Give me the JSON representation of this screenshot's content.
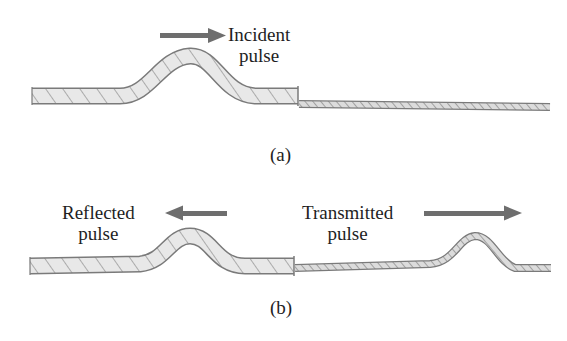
{
  "panels": [
    {
      "id": "a",
      "caption": "(a)",
      "labels": [
        {
          "line1": "Incident",
          "line2": "pulse",
          "arrow_direction": "right"
        }
      ]
    },
    {
      "id": "b",
      "caption": "(b)",
      "labels": [
        {
          "line1": "Reflected",
          "line2": "pulse",
          "arrow_direction": "left"
        },
        {
          "line1": "Transmitted",
          "line2": "pulse",
          "arrow_direction": "right"
        }
      ]
    }
  ],
  "colors": {
    "arrow": "#6e6e6e",
    "rope_fill": "#e8e8e8",
    "rope_stroke": "#7a7a7a",
    "text": "#1e1e1e"
  }
}
